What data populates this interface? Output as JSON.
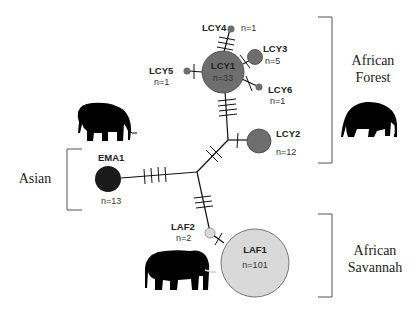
{
  "figure": {
    "type": "haplotype network",
    "regions": {
      "forest": {
        "line1": "African",
        "line2": "Forest"
      },
      "asian": {
        "label": "Asian"
      },
      "savannah": {
        "line1": "African",
        "line2": "Savannah"
      }
    },
    "haplotypes": {
      "LCY1": {
        "name": "LCY1",
        "n": "n=33",
        "color": "#6e6e6e"
      },
      "LCY2": {
        "name": "LCY2",
        "n": "n=12",
        "color": "#6e6e6e"
      },
      "LCY3": {
        "name": "LCY3",
        "n": "n=5",
        "color": "#6e6e6e"
      },
      "LCY4": {
        "name": "LCY4",
        "n": "n=1",
        "color": "#6e6e6e"
      },
      "LCY5": {
        "name": "LCY5",
        "n": "n=1",
        "color": "#6e6e6e"
      },
      "LCY6": {
        "name": "LCY6",
        "n": "n=1",
        "color": "#6e6e6e"
      },
      "EMA1": {
        "name": "EMA1",
        "n": "n=13",
        "color": "#1a1a1a"
      },
      "LAF1": {
        "name": "LAF1",
        "n": "n=101",
        "color": "#d9d9d9"
      },
      "LAF2": {
        "name": "LAF2",
        "n": "n=2",
        "color": "#d9d9d9"
      }
    },
    "icons": [
      "asian-elephant-icon",
      "forest-elephant-icon",
      "savannah-elephant-icon"
    ]
  }
}
